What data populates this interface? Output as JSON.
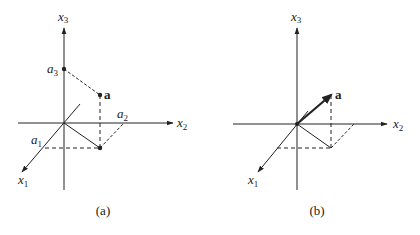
{
  "panels": [
    {
      "id": "a",
      "caption": "(a)",
      "axes": {
        "x1": "x",
        "x1_sub": "1",
        "x2": "x",
        "x2_sub": "2",
        "x3": "x",
        "x3_sub": "3"
      },
      "labels": {
        "a3": "a",
        "a3_sub": "3",
        "a2": "a",
        "a2_sub": "2",
        "a1": "a",
        "a1_sub": "1",
        "point": "a"
      }
    },
    {
      "id": "b",
      "caption": "(b)",
      "axes": {
        "x1": "x",
        "x1_sub": "1",
        "x2": "x",
        "x2_sub": "2",
        "x3": "x",
        "x3_sub": "3"
      },
      "labels": {
        "point": "a"
      }
    }
  ],
  "colors": {
    "ink": "#222222",
    "background": "#ffffff"
  }
}
